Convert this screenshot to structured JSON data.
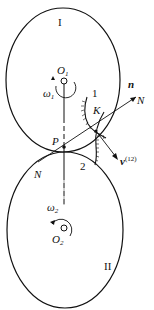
{
  "diagram": {
    "bodies": [
      {
        "id": "I",
        "label": "I",
        "center_label": "O",
        "center_sub": "1",
        "omega_label": "ω",
        "omega_sub": "1"
      },
      {
        "id": "II",
        "label": "II",
        "center_label": "O",
        "center_sub": "2",
        "omega_label": "ω",
        "omega_sub": "2"
      }
    ],
    "points": {
      "pitch_point": "P",
      "contact_point": "K"
    },
    "profiles": {
      "profile1": "1",
      "profile2": "2"
    },
    "normal": {
      "vector_label": "n",
      "line_label_end": "N",
      "line_label_start": "N"
    },
    "velocity": {
      "label": "v",
      "superscript": "(12)"
    }
  }
}
